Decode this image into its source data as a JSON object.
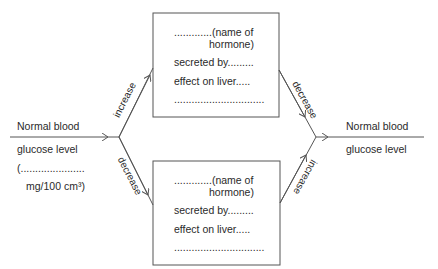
{
  "diagram": {
    "type": "homeostasis-feedback",
    "left_state": {
      "line1": "Normal blood",
      "line2": "glucose level",
      "line3": "(......................",
      "line4": "mg/100 cm³)"
    },
    "right_state": {
      "line1": "Normal blood",
      "line2": "glucose level"
    },
    "arrows": {
      "upper_left": "increase",
      "lower_left": "decrease",
      "upper_right": "decrease",
      "lower_right": "increase"
    },
    "boxes": [
      {
        "name_line1": ".............(name of",
        "name_line2": "hormone)",
        "secreted": "secreted by.........",
        "effect": "effect on liver.....",
        "blank": "..............................."
      },
      {
        "name_line1": ".............(name of",
        "name_line2": "hormone)",
        "secreted": "secreted by.........",
        "effect": "effect on liver.....",
        "blank": "..............................."
      }
    ],
    "colors": {
      "line": "#555555",
      "text": "#2a2a2a"
    }
  }
}
